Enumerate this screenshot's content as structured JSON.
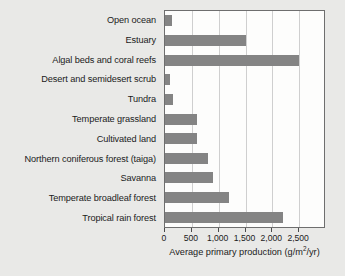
{
  "chart_data": {
    "type": "bar",
    "orientation": "horizontal",
    "title": "",
    "xlabel": "Average primary production (g/m2/yr)",
    "xlabel_parts": {
      "before": "Average primary production (g/m",
      "superscript": "2",
      "after": "/yr)"
    },
    "ylabel": "",
    "xlim": [
      0,
      3000
    ],
    "xticks": [
      0,
      500,
      1000,
      1500,
      2000,
      2500
    ],
    "xticklabels": [
      "0",
      "500",
      "1,000",
      "1,500",
      "2,000",
      "2,500"
    ],
    "grid": "vertical",
    "legend": "none",
    "bar_color": "#848484",
    "plot_background": "#fdfdfc",
    "figure_background": "#e9e9e7",
    "categories": [
      "Open ocean",
      "Estuary",
      "Algal beds and coral reefs",
      "Desert and semidesert scrub",
      "Tundra",
      "Temperate grassland",
      "Cultivated land",
      "Northern coniferous forest (taiga)",
      "Savanna",
      "Temperate broadleaf forest",
      "Tropical rain forest"
    ],
    "values": [
      125,
      1500,
      2500,
      90,
      140,
      600,
      600,
      800,
      900,
      1200,
      2200
    ]
  }
}
